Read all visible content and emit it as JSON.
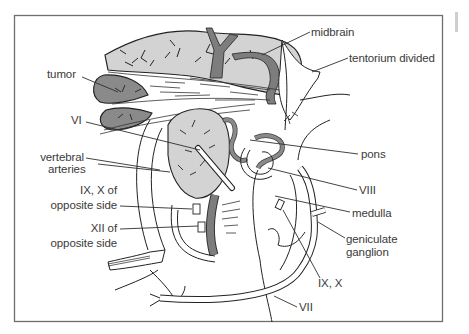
{
  "figure": {
    "type": "anatomical-illustration",
    "colors": {
      "frame": "#6e6e6e",
      "line": "#2f2f2f",
      "brain_fill": "#cfcfcf",
      "tumor_fill": "#8a8a8a",
      "vessel_fill": "#7d7d7d",
      "background": "#ffffff",
      "label_text": "#3a3a3a"
    }
  },
  "labels": {
    "midbrain": "midbrain",
    "tentorium": "tentorium divided",
    "tumor": "tumor",
    "vi": "VI",
    "vertebral_1": "vertebral",
    "vertebral_2": "arteries",
    "ix_x_opp_1": "IX, X of",
    "ix_x_opp_2": "opposite side",
    "xii_opp_1": "XII of",
    "xii_opp_2": "opposite side",
    "pons": "pons",
    "viii": "VIII",
    "medulla": "medulla",
    "geniculate_1": "geniculate",
    "geniculate_2": "ganglion",
    "ix_x": "IX, X",
    "vii": "VII"
  }
}
